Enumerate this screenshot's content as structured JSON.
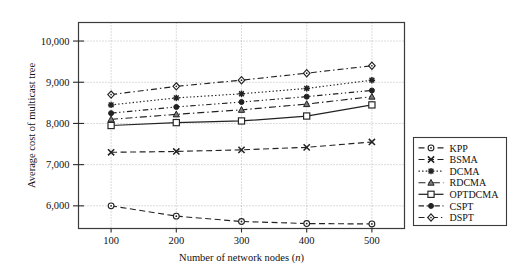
{
  "chart_data": {
    "type": "line",
    "title": "",
    "xlabel": "Number of network nodes (n)",
    "xlabel_main": "Number of network nodes (",
    "xlabel_italic": "n",
    "xlabel_tail": ")",
    "ylabel": "Average cost of multicast tree",
    "x": [
      100,
      200,
      300,
      400,
      500
    ],
    "xticklabels": [
      "100",
      "200",
      "300",
      "400",
      "500"
    ],
    "yticks": [
      6000,
      7000,
      8000,
      9000,
      10000
    ],
    "yticklabels": [
      "6,000",
      "7,000",
      "8,000",
      "9,000",
      "10,000"
    ],
    "xlim": [
      50,
      550
    ],
    "ylim": [
      5450,
      10450
    ],
    "grid": "dotted-both",
    "legend_position": "right-outside-lower",
    "series": [
      {
        "name": "KPP",
        "values": [
          6000,
          5750,
          5620,
          5570,
          5560
        ],
        "marker": "circle",
        "dash": "dashed"
      },
      {
        "name": "BSMA",
        "values": [
          7300,
          7320,
          7360,
          7420,
          7550
        ],
        "marker": "x",
        "dash": "dashed"
      },
      {
        "name": "DCMA",
        "values": [
          8450,
          8620,
          8720,
          8850,
          9050
        ],
        "marker": "star",
        "dash": "dotted"
      },
      {
        "name": "RDCMA",
        "values": [
          8100,
          8220,
          8330,
          8470,
          8650
        ],
        "marker": "triangle",
        "dash": "dashdot"
      },
      {
        "name": "OPTDCMA",
        "values": [
          7950,
          8020,
          8060,
          8180,
          8450
        ],
        "marker": "square",
        "dash": "solid"
      },
      {
        "name": "CSPT",
        "values": [
          8250,
          8400,
          8520,
          8650,
          8800
        ],
        "marker": "dot",
        "dash": "dashdotdot"
      },
      {
        "name": "DSPT",
        "values": [
          8700,
          8900,
          9050,
          9220,
          9400
        ],
        "marker": "diamond",
        "dash": "dashdot2"
      }
    ]
  },
  "legend": {
    "entries": [
      "KPP",
      "BSMA",
      "DCMA",
      "RDCMA",
      "OPTDCMA",
      "CSPT",
      "DSPT"
    ]
  }
}
